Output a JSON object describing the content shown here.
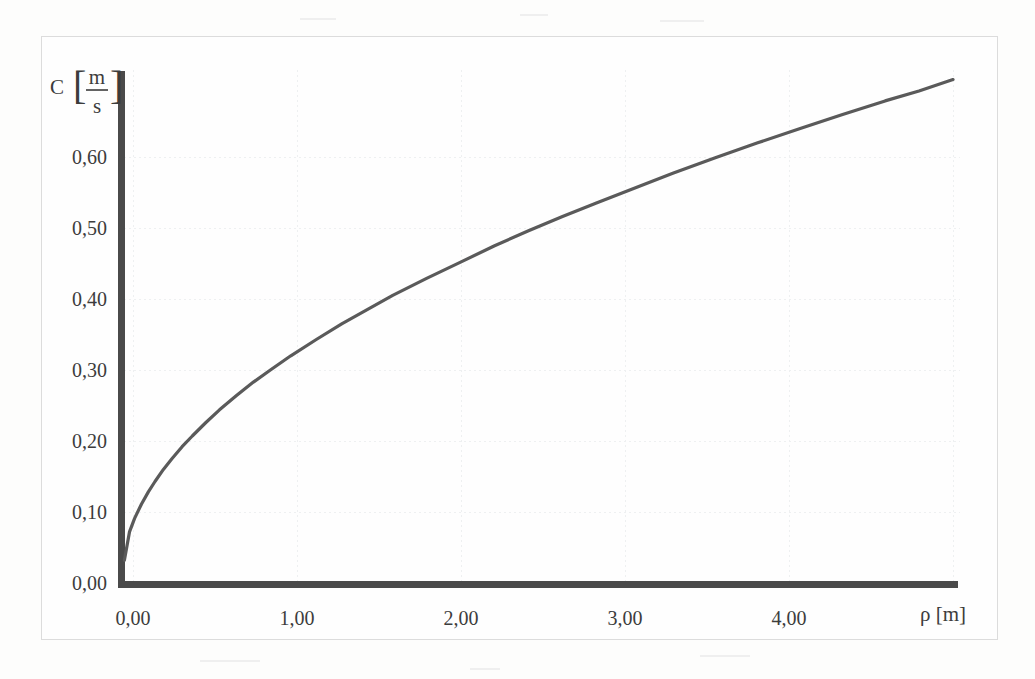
{
  "figure": {
    "background_color": "#fdfdfc",
    "frame_color": "#dcdcdc",
    "axis_color": "#4a4a4a",
    "curve_color": "#5a5a5a",
    "grid_color": "#eceef0",
    "text_color": "#3c3c3c"
  },
  "labels": {
    "y_axis_symbol": "C",
    "y_axis_unit_numerator": "m",
    "y_axis_unit_denominator": "s",
    "y_bracket_open": "[",
    "y_bracket_close": "]",
    "x_axis_title": "ρ [m]"
  },
  "chart_data": {
    "type": "line",
    "title": "",
    "subtitle": "",
    "xlabel": "ρ [m]",
    "ylabel": "C [m/s]",
    "xlim": [
      0.0,
      4.9
    ],
    "ylim": [
      0.0,
      0.68
    ],
    "grid": true,
    "grid_style": "faint dotted",
    "legend": "none",
    "relation": "C ≈ 0.32 · √ρ",
    "xticks": [
      0.0,
      1.0,
      2.0,
      3.0,
      4.0
    ],
    "xtick_labels": [
      "0,00",
      "1,00",
      "2,00",
      "3,00",
      "4,00"
    ],
    "yticks": [
      0.0,
      0.1,
      0.2,
      0.3,
      0.4,
      0.5,
      0.6
    ],
    "ytick_labels": [
      "0,00",
      "0,10",
      "0,20",
      "0,30",
      "0,40",
      "0,50",
      "0,60"
    ],
    "series": [
      {
        "name": "C(ρ)",
        "x": [
          0.02,
          0.05,
          0.08,
          0.12,
          0.16,
          0.2,
          0.25,
          0.3,
          0.36,
          0.42,
          0.5,
          0.58,
          0.68,
          0.78,
          0.88,
          1.0,
          1.15,
          1.3,
          1.45,
          1.6,
          1.8,
          2.0,
          2.2,
          2.4,
          2.6,
          2.8,
          3.0,
          3.25,
          3.5,
          3.75,
          4.0,
          4.25,
          4.5,
          4.7,
          4.9
        ],
        "y": [
          0.032,
          0.072,
          0.091,
          0.111,
          0.128,
          0.143,
          0.16,
          0.175,
          0.192,
          0.207,
          0.226,
          0.244,
          0.264,
          0.283,
          0.3,
          0.32,
          0.343,
          0.365,
          0.385,
          0.405,
          0.429,
          0.452,
          0.475,
          0.496,
          0.516,
          0.535,
          0.554,
          0.577,
          0.599,
          0.62,
          0.64,
          0.66,
          0.679,
          0.693,
          0.709
        ]
      }
    ]
  }
}
